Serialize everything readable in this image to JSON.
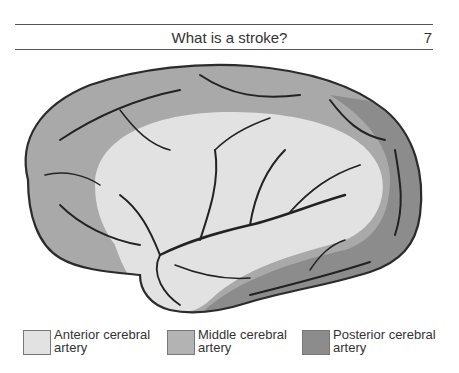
{
  "header": {
    "title": "What is a stroke?",
    "page_number": "7"
  },
  "figure": {
    "colors": {
      "outline": "#2b2b2b",
      "vessel": "#222222",
      "outer_gray": "#a9a9a9",
      "posterior_dark": "#8c8c8c",
      "central_light": "#e2e2e2"
    }
  },
  "legend": {
    "items": [
      {
        "label_line1": "Anterior cerebral",
        "label_line2": "artery",
        "color": "#e2e2e2"
      },
      {
        "label_line1": "Middle cerebral",
        "label_line2": "artery",
        "color": "#b3b3b3"
      },
      {
        "label_line1": "Posterior cerebral",
        "label_line2": "artery",
        "color": "#8c8c8c"
      }
    ]
  }
}
